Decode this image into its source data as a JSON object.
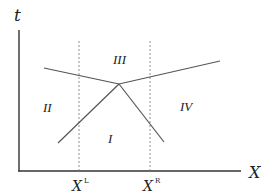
{
  "diagram": {
    "axes": {
      "y_label": "t",
      "x_label": "X"
    },
    "ticks": [
      {
        "base": "X",
        "superscript": "L",
        "x": 79
      },
      {
        "base": "X",
        "superscript": "R",
        "x": 150
      }
    ],
    "regions": [
      {
        "label": "I",
        "x": 124,
        "y": 144
      },
      {
        "label": "II",
        "x": 50,
        "y": 111
      },
      {
        "label": "III",
        "x": 122,
        "y": 60
      },
      {
        "label": "IV",
        "x": 185,
        "y": 109
      }
    ],
    "vertex": {
      "x": 119,
      "y": 84
    },
    "lines": [
      {
        "name": "upper-left",
        "from": [
          44,
          68
        ],
        "to": [
          119,
          84
        ]
      },
      {
        "name": "upper-right",
        "from": [
          119,
          84
        ],
        "to": [
          220,
          61
        ]
      },
      {
        "name": "lower-left",
        "from": [
          58,
          143
        ],
        "to": [
          119,
          84
        ]
      },
      {
        "name": "lower-right",
        "from": [
          119,
          84
        ],
        "to": [
          164,
          142
        ]
      }
    ],
    "colors": {
      "axis": "#333333",
      "line": "#555555",
      "dashed": "#777777",
      "text": "#222222"
    }
  }
}
